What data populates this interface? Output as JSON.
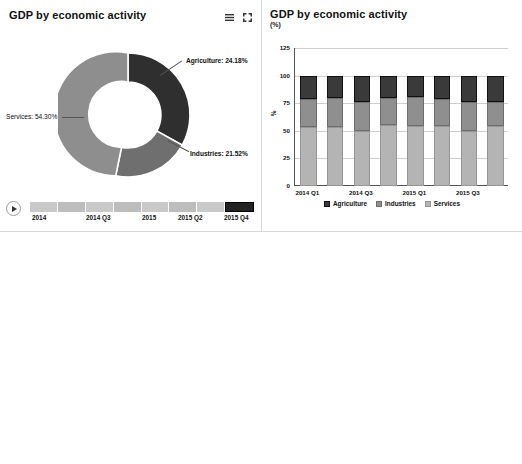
{
  "panels": {
    "donut": {
      "title": "GDP by economic activity",
      "icons": {
        "menu": "menu-icon",
        "expand": "expand-icon"
      },
      "labels": {
        "agriculture": "Agriculture: 24.18%",
        "services": "Services: 54.30%",
        "industries": "Industries: 21.52%"
      },
      "slider": {
        "play": "play-button",
        "ticks": [
          "2014",
          "2014 Q3",
          "2015",
          "2015 Q2",
          "2015 Q4"
        ],
        "segments": 8,
        "selected_index": 7
      }
    },
    "stacked": {
      "title": "GDP by economic activity",
      "unit": "(%)"
    },
    "agriculture": {
      "title": "Agriculture",
      "unit": "(%)"
    }
  },
  "colors": {
    "agriculture": "#3a3a3a",
    "industries": "#8f8f8f",
    "services": "#b4b4b4",
    "contribution": "#4a4a4a",
    "growth": "#9e9e9e"
  },
  "chart_data": [
    {
      "type": "pie",
      "title": "GDP by economic activity",
      "labels": [
        "Agriculture",
        "Industries",
        "Services"
      ],
      "values": [
        24.18,
        21.52,
        54.3
      ],
      "unit": "%",
      "donut": true,
      "legend": "callout-labels"
    },
    {
      "type": "bar",
      "stacked": true,
      "title": "GDP by economic activity",
      "ylabel": "%",
      "unit": "(%)",
      "ylim": [
        0,
        125
      ],
      "yticks": [
        0,
        25,
        50,
        75,
        100,
        125
      ],
      "grid": true,
      "legend": [
        "Agriculture",
        "Industries",
        "Services"
      ],
      "legend_position": "bottom",
      "categories": [
        "2014 Q1",
        "2014 Q2",
        "2014 Q3",
        "2014 Q4",
        "2015 Q1",
        "2015 Q2",
        "2015 Q3",
        "2015 Q4"
      ],
      "xtick_labels": [
        "2014 Q1",
        "",
        "2014 Q3",
        "",
        "2015 Q1",
        "",
        "2015 Q3",
        ""
      ],
      "series": [
        {
          "name": "Services",
          "values": [
            53.0,
            53.5,
            49.5,
            55.0,
            54.5,
            54.5,
            49.5,
            54.3
          ]
        },
        {
          "name": "Industries",
          "values": [
            26.0,
            26.0,
            27.0,
            25.0,
            26.0,
            24.5,
            26.5,
            21.5
          ]
        },
        {
          "name": "Agriculture",
          "values": [
            21.0,
            20.5,
            23.5,
            20.0,
            19.5,
            21.0,
            24.0,
            24.2
          ]
        }
      ]
    },
    {
      "type": "bar",
      "title": "Agriculture",
      "ylabel": "%",
      "unit": "(%)",
      "ylim": [
        0,
        30
      ],
      "yticks": [
        0,
        5,
        10,
        15,
        20,
        25,
        30
      ],
      "grid": true,
      "legend": [
        "Contribution to GDP (%)",
        "Growth (year on year,%)"
      ],
      "legend_position": "bottom",
      "categories": [
        "2014 Q1",
        "2014 Q2",
        "2014 Q3",
        "2014 Q4",
        "2015 Q1",
        "2015 Q2",
        "2015 Q3",
        "2015 Q4"
      ],
      "series": [
        {
          "name": "Contribution to GDP (%)",
          "values": [
            19.5,
            20.7,
            26.4,
            23.6,
            19.5,
            20.8,
            26.7,
            23.9
          ]
        },
        {
          "name": "Growth (year on year,%)",
          "values": [
            5.4,
            3.6,
            4.4,
            3.6,
            4.7,
            3.5,
            3.5,
            3.5
          ]
        }
      ]
    }
  ]
}
